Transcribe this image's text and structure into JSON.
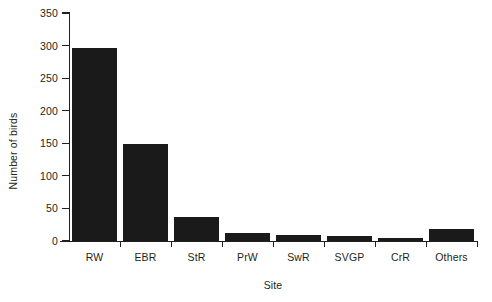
{
  "chart_data": {
    "type": "bar",
    "title": "",
    "xlabel": "Site",
    "ylabel": "Number of birds",
    "categories": [
      "RW",
      "EBR",
      "StR",
      "PrW",
      "SwR",
      "SVGP",
      "CrR",
      "Others"
    ],
    "values": [
      296,
      149,
      37,
      12,
      9,
      8,
      4,
      18
    ],
    "ylim": [
      0,
      350
    ],
    "yticks": [
      0,
      50,
      100,
      150,
      200,
      250,
      300,
      350
    ],
    "ytick_labels": [
      "0",
      "50",
      "100",
      "150",
      "200",
      "250",
      "300",
      "350"
    ],
    "grid": false,
    "legend": false,
    "bar_color": "#1a1a1a",
    "axis_color": "#231f20",
    "background": "#ffffff"
  }
}
